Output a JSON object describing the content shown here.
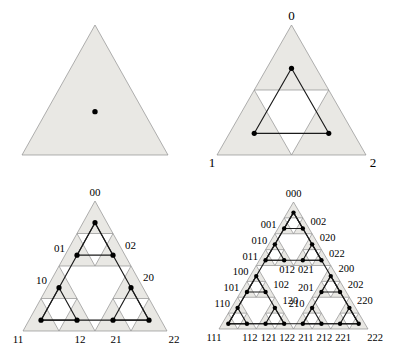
{
  "colors": {
    "background": "#ffffff",
    "cell_fill": "#e9e8e4",
    "grid_stroke": "#8f8f8f",
    "line": "#1b1b1b",
    "dot": "#000000",
    "label": "#000000"
  },
  "panels": [
    {
      "id": "stage-0",
      "depth": 0,
      "apex": [
        95,
        25
      ],
      "left": [
        22,
        155
      ],
      "right": [
        168,
        155
      ],
      "font_size": 13,
      "dot_radius": 2.7,
      "labels": []
    },
    {
      "id": "stage-1",
      "depth": 1,
      "apex": [
        291.5,
        25
      ],
      "left": [
        217,
        155
      ],
      "right": [
        366,
        155
      ],
      "font_size": 13,
      "dot_radius": 2.6,
      "labels": [
        {
          "text": "0",
          "addr": "0",
          "side": "above"
        },
        {
          "text": "1",
          "addr": "1",
          "side": "corner-left"
        },
        {
          "text": "2",
          "addr": "2",
          "side": "corner-right"
        }
      ]
    },
    {
      "id": "stage-2",
      "depth": 2,
      "apex": [
        95,
        201
      ],
      "left": [
        23,
        331
      ],
      "right": [
        167,
        331
      ],
      "font_size": 11,
      "dot_radius": 2.6,
      "labels": [
        {
          "text": "00",
          "addr": "00",
          "side": "above"
        },
        {
          "text": "01",
          "addr": "01",
          "side": "left"
        },
        {
          "text": "02",
          "addr": "02",
          "side": "right"
        },
        {
          "text": "10",
          "addr": "10",
          "side": "left"
        },
        {
          "text": "20",
          "addr": "20",
          "side": "right"
        },
        {
          "text": "11",
          "addr": "11",
          "side": "corner-left"
        },
        {
          "text": "12",
          "addr": "12",
          "side": "below"
        },
        {
          "text": "21",
          "addr": "21",
          "side": "below"
        },
        {
          "text": "22",
          "addr": "22",
          "side": "corner-right"
        }
      ]
    },
    {
      "id": "stage-3",
      "depth": 3,
      "apex": [
        293.5,
        202
      ],
      "left": [
        219,
        329
      ],
      "right": [
        368,
        329
      ],
      "font_size": 10.5,
      "dot_radius": 2.2,
      "labels": [
        {
          "text": "000",
          "addr": "000",
          "side": "above"
        },
        {
          "text": "001",
          "addr": "001",
          "side": "left"
        },
        {
          "text": "002",
          "addr": "002",
          "side": "right"
        },
        {
          "text": "010",
          "addr": "010",
          "side": "left"
        },
        {
          "text": "020",
          "addr": "020",
          "side": "right"
        },
        {
          "text": "011",
          "addr": "011",
          "side": "left"
        },
        {
          "text": "022",
          "addr": "022",
          "side": "right"
        },
        {
          "text": "012",
          "addr": "012",
          "side": "below"
        },
        {
          "text": "021",
          "addr": "021",
          "side": "below"
        },
        {
          "text": "100",
          "addr": "100",
          "side": "left"
        },
        {
          "text": "200",
          "addr": "200",
          "side": "right"
        },
        {
          "text": "101",
          "addr": "101",
          "side": "left"
        },
        {
          "text": "102",
          "addr": "102",
          "side": "right"
        },
        {
          "text": "201",
          "addr": "201",
          "side": "left"
        },
        {
          "text": "202",
          "addr": "202",
          "side": "right"
        },
        {
          "text": "110",
          "addr": "110",
          "side": "left"
        },
        {
          "text": "120",
          "addr": "120",
          "side": "right"
        },
        {
          "text": "210",
          "addr": "210",
          "side": "left"
        },
        {
          "text": "220",
          "addr": "220",
          "side": "right"
        },
        {
          "text": "111",
          "addr": "111",
          "side": "corner-left"
        },
        {
          "text": "112",
          "addr": "112",
          "side": "below"
        },
        {
          "text": "121",
          "addr": "121",
          "side": "below"
        },
        {
          "text": "122",
          "addr": "122",
          "side": "below"
        },
        {
          "text": "211",
          "addr": "211",
          "side": "below"
        },
        {
          "text": "212",
          "addr": "212",
          "side": "below"
        },
        {
          "text": "221",
          "addr": "221",
          "side": "below"
        },
        {
          "text": "222",
          "addr": "222",
          "side": "corner-right"
        }
      ]
    }
  ]
}
